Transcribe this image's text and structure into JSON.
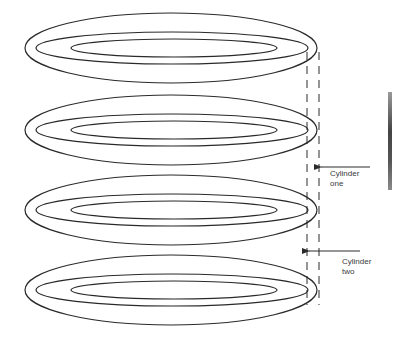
{
  "diagram": {
    "stroke_color": "#2a2a2a",
    "background": "#ffffff",
    "platters": [
      {
        "name": "platter-1",
        "cy": 48
      },
      {
        "name": "platter-2",
        "cy": 130
      },
      {
        "name": "platter-3",
        "cy": 210
      },
      {
        "name": "platter-4",
        "cy": 290
      }
    ],
    "track_geometry": {
      "outer": {
        "cx": 171,
        "rx": 146,
        "ry": 35
      },
      "middle": {
        "cx": 172,
        "rx": 136,
        "ry": 16
      },
      "inner": {
        "cx": 174,
        "rx": 103,
        "ry": 9
      }
    },
    "cylinder_lines": [
      {
        "name": "cylinder-two-line",
        "x": 307,
        "y1": 52,
        "y2": 305
      },
      {
        "name": "cylinder-one-line",
        "x": 319,
        "y1": 52,
        "y2": 305
      }
    ],
    "annotations": [
      {
        "name": "cylinder-one",
        "line1": "Cylinder",
        "line2": "one",
        "arrow": {
          "x1": 370,
          "y": 167,
          "x2": 321
        }
      },
      {
        "name": "cylinder-two",
        "line1": "Cylinder",
        "line2": "two",
        "arrow": {
          "x1": 360,
          "y": 251,
          "x2": 309
        }
      }
    ],
    "edge_bar": {
      "x": 388,
      "y": 92,
      "width": 4,
      "height": 98
    }
  }
}
